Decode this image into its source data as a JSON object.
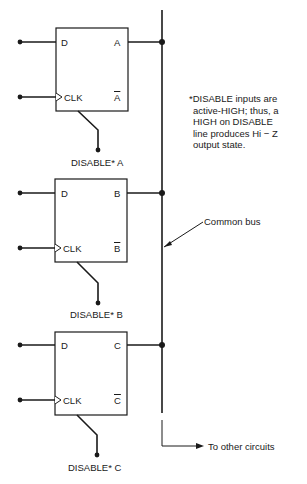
{
  "diagram": {
    "flipflops": [
      {
        "id": "A",
        "d_label": "D",
        "clk_label": "CLK",
        "q_label": "A",
        "qbar_label": "A",
        "disable_label": "DISABLE* A"
      },
      {
        "id": "B",
        "d_label": "D",
        "clk_label": "CLK",
        "q_label": "B",
        "qbar_label": "B",
        "disable_label": "DISABLE* B"
      },
      {
        "id": "C",
        "d_label": "D",
        "clk_label": "CLK",
        "q_label": "C",
        "qbar_label": "C",
        "disable_label": "DISABLE* C"
      }
    ],
    "bus_label": "Common bus",
    "other_label": "To other circuits",
    "note_lines": [
      "*DISABLE inputs are",
      "active-HIGH; thus, a",
      "HIGH on DISABLE",
      "line produces Hi − Z",
      "output state."
    ]
  }
}
